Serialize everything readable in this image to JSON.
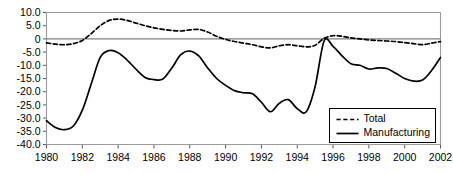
{
  "chart_data": {
    "type": "line",
    "title": "",
    "subtitle": "",
    "xlabel": "",
    "ylabel": "",
    "xlim": [
      1980,
      2002
    ],
    "ylim": [
      -40.0,
      10.0
    ],
    "grid": false,
    "zero_line": true,
    "legend_position": "bottom-right",
    "y_ticks": [
      10.0,
      5.0,
      0,
      -5.0,
      -10.0,
      -15.0,
      -20.0,
      -25.0,
      -30.0,
      -35.0,
      -40.0
    ],
    "y_tick_labels": [
      "10.0",
      "5.0",
      "0",
      "-5.0",
      "-10.0",
      "-15.0",
      "-20.0",
      "-25.0",
      "-30.0",
      "-35.0",
      "-40.0"
    ],
    "x_ticks": [
      1980,
      1982,
      1984,
      1986,
      1988,
      1990,
      1992,
      1994,
      1996,
      1998,
      2000,
      2002
    ],
    "x_tick_labels": [
      "1980",
      "1982",
      "1984",
      "1986",
      "1988",
      "1990",
      "1992",
      "1994",
      "1996",
      "1998",
      "2000",
      "2002"
    ],
    "series": [
      {
        "name": "Total",
        "style": "dashed",
        "color": "#000000",
        "x": [
          1980.0,
          1980.5,
          1981.0,
          1981.5,
          1982.0,
          1982.5,
          1983.0,
          1983.5,
          1984.0,
          1984.5,
          1985.0,
          1985.5,
          1986.0,
          1986.5,
          1987.0,
          1987.5,
          1988.0,
          1988.5,
          1989.0,
          1989.5,
          1990.0,
          1990.5,
          1991.0,
          1991.5,
          1992.0,
          1992.5,
          1993.0,
          1993.5,
          1994.0,
          1994.5,
          1995.0,
          1995.5,
          1996.0,
          1996.5,
          1997.0,
          1997.5,
          1998.0,
          1998.5,
          1999.0,
          1999.5,
          2000.0,
          2000.5,
          2001.0,
          2001.5,
          2002.0
        ],
        "values": [
          -1.5,
          -2.0,
          -2.2,
          -1.8,
          -0.6,
          2.0,
          5.0,
          7.0,
          7.5,
          7.0,
          6.0,
          5.0,
          4.2,
          3.6,
          3.2,
          3.0,
          3.4,
          3.6,
          2.6,
          1.0,
          -0.2,
          -1.0,
          -1.6,
          -2.2,
          -3.0,
          -3.4,
          -2.6,
          -2.2,
          -2.6,
          -3.0,
          -2.4,
          0.2,
          1.2,
          1.0,
          0.4,
          0.0,
          -0.4,
          -0.6,
          -0.8,
          -1.0,
          -1.4,
          -1.8,
          -2.2,
          -1.6,
          -1.0
        ]
      },
      {
        "name": "Manufacturing",
        "style": "solid",
        "color": "#000000",
        "x": [
          1980.0,
          1980.5,
          1981.0,
          1981.5,
          1982.0,
          1982.5,
          1983.0,
          1983.5,
          1984.0,
          1984.5,
          1985.0,
          1985.5,
          1986.0,
          1986.5,
          1987.0,
          1987.5,
          1988.0,
          1988.5,
          1989.0,
          1989.5,
          1990.0,
          1990.5,
          1991.0,
          1991.5,
          1992.0,
          1992.5,
          1993.0,
          1993.5,
          1994.0,
          1994.5,
          1995.0,
          1995.5,
          1996.0,
          1996.5,
          1997.0,
          1997.5,
          1998.0,
          1998.5,
          1999.0,
          1999.5,
          2000.0,
          2000.5,
          2001.0,
          2001.5,
          2002.0
        ],
        "values": [
          -31.0,
          -33.6,
          -34.4,
          -33.0,
          -27.0,
          -17.0,
          -7.0,
          -4.4,
          -5.2,
          -8.0,
          -11.5,
          -14.6,
          -15.4,
          -15.2,
          -11.0,
          -6.0,
          -4.6,
          -6.4,
          -11.0,
          -15.0,
          -17.6,
          -19.6,
          -20.4,
          -20.8,
          -24.0,
          -27.6,
          -24.4,
          -23.0,
          -26.4,
          -27.6,
          -18.0,
          -0.8,
          -2.8,
          -6.4,
          -9.4,
          -10.0,
          -11.4,
          -11.0,
          -11.2,
          -13.0,
          -15.0,
          -16.0,
          -15.6,
          -12.0,
          -7.0
        ]
      }
    ]
  },
  "legend": {
    "entries": [
      {
        "label": "Total",
        "style": "dashed"
      },
      {
        "label": "Manufacturing",
        "style": "solid"
      }
    ]
  }
}
